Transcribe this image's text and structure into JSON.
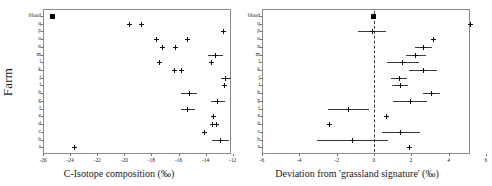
{
  "figure": {
    "panels": [
      {
        "id": "left",
        "ylabel": "Farm",
        "xlabel": "C-Isotope composition (‰)",
        "xticks": [
          "-26",
          "-24",
          "-22",
          "-20",
          "-18",
          "-16",
          "-14",
          "-12"
        ],
        "yticks": [
          "blood",
          "q",
          "p",
          "o",
          "n",
          "m",
          "l",
          "k",
          "j",
          "i",
          "h",
          "g",
          "f",
          "e",
          "d",
          "c",
          "b",
          "a"
        ]
      },
      {
        "id": "right",
        "ylabel": "",
        "xlabel": "Deviation from 'grassland signature' (‰)",
        "xticks": [
          "-6",
          "-4",
          "-2",
          "0",
          "2",
          "4",
          "6"
        ],
        "yticks": [
          "blood",
          "q",
          "p",
          "o",
          "n",
          "m",
          "l",
          "k",
          "j",
          "i",
          "h",
          "g",
          "f",
          "e",
          "d",
          "c",
          "b",
          "a"
        ]
      }
    ]
  },
  "chart_data": [
    {
      "type": "scatter",
      "panel": "left",
      "title": "",
      "xlabel": "C-Isotope composition (‰)",
      "ylabel": "Farm",
      "xlim": [
        -26.6,
        -11.4
      ],
      "xticks": [
        -26,
        -24,
        -22,
        -20,
        -18,
        -16,
        -14,
        -12
      ],
      "grid": false,
      "legend": null,
      "categories": [
        "blood",
        "q",
        "p",
        "o",
        "n",
        "m",
        "l",
        "k",
        "j",
        "i",
        "h",
        "g",
        "f",
        "e",
        "d",
        "c",
        "b",
        "a"
      ],
      "points": [
        {
          "y": "blood",
          "x": -25.3,
          "err": 0.0,
          "marker": "square"
        },
        {
          "y": "q",
          "x": -19.6,
          "err": 0.0,
          "marker": "cross"
        },
        {
          "y": "q",
          "x": -18.7,
          "err": 0.0,
          "marker": "cross"
        },
        {
          "y": "p",
          "x": -12.7,
          "err": 0.0,
          "marker": "cross"
        },
        {
          "y": "o",
          "x": -17.6,
          "err": 0.0,
          "marker": "cross"
        },
        {
          "y": "o",
          "x": -15.3,
          "err": 0.0,
          "marker": "cross"
        },
        {
          "y": "n",
          "x": -17.2,
          "err": 0.0,
          "marker": "cross"
        },
        {
          "y": "n",
          "x": -16.2,
          "err": 0.0,
          "marker": "cross"
        },
        {
          "y": "m",
          "x": -13.3,
          "err": 0.55,
          "marker": "cross"
        },
        {
          "y": "l",
          "x": -17.4,
          "err": 0.0,
          "marker": "cross"
        },
        {
          "y": "l",
          "x": -13.6,
          "err": 0.0,
          "marker": "cross"
        },
        {
          "y": "k",
          "x": -16.3,
          "err": 0.0,
          "marker": "cross"
        },
        {
          "y": "k",
          "x": -15.8,
          "err": 0.0,
          "marker": "cross"
        },
        {
          "y": "j",
          "x": -12.5,
          "err": 0.35,
          "marker": "cross"
        },
        {
          "y": "i",
          "x": -12.6,
          "err": 0.0,
          "marker": "cross"
        },
        {
          "y": "h",
          "x": -15.2,
          "err": 0.6,
          "marker": "cross"
        },
        {
          "y": "g",
          "x": -13.1,
          "err": 0.5,
          "marker": "cross"
        },
        {
          "y": "f",
          "x": -15.3,
          "err": 0.55,
          "marker": "cross"
        },
        {
          "y": "e",
          "x": -13.4,
          "err": 0.0,
          "marker": "cross"
        },
        {
          "y": "d",
          "x": -13.5,
          "err": 0.0,
          "marker": "cross"
        },
        {
          "y": "d",
          "x": -13.2,
          "err": 0.0,
          "marker": "cross"
        },
        {
          "y": "c",
          "x": -14.1,
          "err": 0.2,
          "marker": "cross"
        },
        {
          "y": "b",
          "x": -12.9,
          "err": 0.65,
          "marker": "cross"
        },
        {
          "y": "a",
          "x": -23.7,
          "err": 0.0,
          "marker": "cross"
        }
      ]
    },
    {
      "type": "scatter",
      "panel": "right",
      "title": "",
      "xlabel": "Deviation from 'grassland signature' (‰)",
      "ylabel": "",
      "xlim": [
        -6.3,
        6.3
      ],
      "xticks": [
        -6,
        -4,
        -2,
        0,
        2,
        4,
        6
      ],
      "grid": false,
      "reference_line": 0,
      "legend": null,
      "categories": [
        "blood",
        "q",
        "p",
        "o",
        "n",
        "m",
        "l",
        "k",
        "j",
        "i",
        "h",
        "g",
        "f",
        "e",
        "d",
        "c",
        "b",
        "a"
      ],
      "points": [
        {
          "y": "blood",
          "x": 0.0,
          "err": 0.0,
          "marker": "square"
        },
        {
          "y": "q",
          "x": 5.2,
          "err": 0.0,
          "marker": "cross"
        },
        {
          "y": "p",
          "x": -0.1,
          "err": 0.75,
          "marker": "cross"
        },
        {
          "y": "o",
          "x": 3.2,
          "err": 0.0,
          "marker": "cross"
        },
        {
          "y": "n",
          "x": 2.65,
          "err": 0.45,
          "marker": "cross"
        },
        {
          "y": "m",
          "x": 2.25,
          "err": 0.55,
          "marker": "cross"
        },
        {
          "y": "l",
          "x": 1.55,
          "err": 0.85,
          "marker": "cross"
        },
        {
          "y": "k",
          "x": 2.65,
          "err": 0.75,
          "marker": "cross"
        },
        {
          "y": "j",
          "x": 1.35,
          "err": 0.45,
          "marker": "cross"
        },
        {
          "y": "i",
          "x": 1.4,
          "err": 0.45,
          "marker": "cross"
        },
        {
          "y": "h",
          "x": 3.1,
          "err": 0.45,
          "marker": "cross"
        },
        {
          "y": "g",
          "x": 1.95,
          "err": 0.9,
          "marker": "cross"
        },
        {
          "y": "f",
          "x": -1.35,
          "err": 1.1,
          "marker": "cross"
        },
        {
          "y": "e",
          "x": 0.65,
          "err": 0.0,
          "marker": "cross"
        },
        {
          "y": "d",
          "x": -2.4,
          "err": 0.0,
          "marker": "cross"
        },
        {
          "y": "c",
          "x": 1.45,
          "err": 1.0,
          "marker": "cross"
        },
        {
          "y": "b",
          "x": -1.15,
          "err": 1.9,
          "marker": "cross"
        },
        {
          "y": "a",
          "x": 1.9,
          "err": 0.0,
          "marker": "cross"
        }
      ]
    }
  ]
}
